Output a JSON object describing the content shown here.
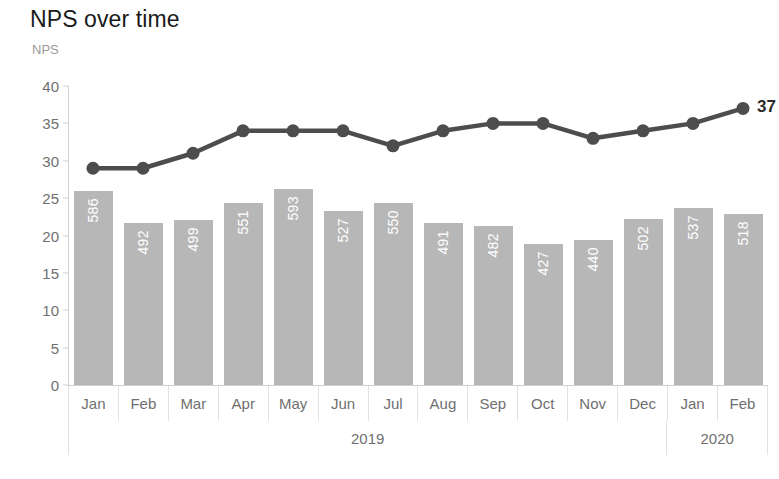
{
  "chart_data": {
    "type": "bar",
    "title": "NPS over time",
    "xlabel": "",
    "ylabel": "NPS",
    "ylim": [
      0,
      40
    ],
    "yticks": [
      40,
      35,
      30,
      25,
      20,
      15,
      10,
      5,
      0
    ],
    "grid": false,
    "legend": false,
    "categories": [
      "Jan",
      "Feb",
      "Mar",
      "Apr",
      "May",
      "Jun",
      "Jul",
      "Aug",
      "Sep",
      "Oct",
      "Nov",
      "Dec",
      "Jan",
      "Feb"
    ],
    "groups": [
      {
        "label": "2019",
        "span": 12
      },
      {
        "label": "2020",
        "span": 2
      }
    ],
    "series": [
      {
        "name": "Responses",
        "type": "bar",
        "color": "#b7b7b7",
        "label_color": "#ffffff",
        "values": [
          586,
          492,
          499,
          551,
          593,
          527,
          550,
          491,
          482,
          427,
          440,
          502,
          537,
          518
        ]
      },
      {
        "name": "NPS",
        "type": "line",
        "color": "#4d4d4d",
        "values": [
          29,
          29,
          31,
          34,
          34,
          34,
          32,
          34,
          35,
          35,
          33,
          34,
          35,
          37
        ],
        "end_label": "37"
      }
    ]
  },
  "colors": {
    "bar": "#b7b7b7",
    "line": "#4d4d4d",
    "axis": "#d0d0d0",
    "tick_text": "#6f6f6f",
    "title": "#1a1a1a",
    "axis_title": "#9a9a9a"
  }
}
